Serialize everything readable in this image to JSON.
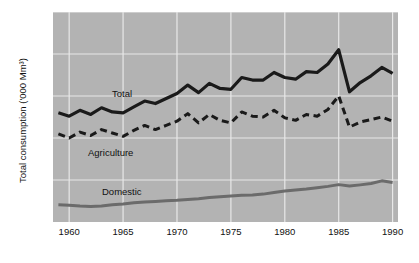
{
  "chart_data": {
    "type": "line",
    "title": "",
    "xlabel": "",
    "ylabel": "Total consumption ('000 Mm³)",
    "xlim": [
      1958.5,
      1990.5
    ],
    "ylim": [
      0,
      2.5
    ],
    "grid": true,
    "legend_position": "inline-annotations",
    "background_color": "#b3b3b3",
    "gridline_color": "#e8e8e8",
    "x_ticks": [
      1960,
      1965,
      1970,
      1975,
      1980,
      1985,
      1990
    ],
    "x_tick_labels": [
      "1960",
      "1965",
      "1970",
      "1975",
      "1980",
      "1985",
      "1990"
    ],
    "y_ticks": [
      0,
      0.5,
      1.0,
      1.5,
      2.0,
      2.5
    ],
    "y_tick_labels": [
      "0",
      ".5",
      "1.0",
      "1.5",
      "2.0",
      "2.5"
    ],
    "x": [
      1959,
      1960,
      1961,
      1962,
      1963,
      1964,
      1965,
      1966,
      1967,
      1968,
      1969,
      1970,
      1971,
      1972,
      1973,
      1974,
      1975,
      1976,
      1977,
      1978,
      1979,
      1980,
      1981,
      1982,
      1983,
      1984,
      1985,
      1986,
      1987,
      1988,
      1989,
      1990
    ],
    "series": [
      {
        "name": "Total",
        "label": "Total",
        "color": "#1a1a1a",
        "style": "solid",
        "width": 3.2,
        "values": [
          1.3,
          1.26,
          1.33,
          1.28,
          1.36,
          1.31,
          1.3,
          1.37,
          1.44,
          1.41,
          1.47,
          1.53,
          1.63,
          1.54,
          1.65,
          1.59,
          1.58,
          1.72,
          1.69,
          1.69,
          1.78,
          1.72,
          1.7,
          1.79,
          1.78,
          1.88,
          2.05,
          1.55,
          1.66,
          1.74,
          1.84,
          1.77
        ]
      },
      {
        "name": "Agriculture",
        "label": "Agriculture",
        "color": "#1a1a1a",
        "style": "dashed",
        "width": 3.0,
        "values": [
          1.05,
          1.0,
          1.07,
          1.03,
          1.1,
          1.06,
          1.02,
          1.09,
          1.15,
          1.1,
          1.15,
          1.2,
          1.29,
          1.18,
          1.28,
          1.21,
          1.18,
          1.31,
          1.26,
          1.25,
          1.33,
          1.24,
          1.21,
          1.28,
          1.26,
          1.34,
          1.5,
          1.13,
          1.19,
          1.22,
          1.25,
          1.2
        ]
      },
      {
        "name": "Domestic",
        "label": "Domestic",
        "color": "#6b6b6b",
        "style": "solid",
        "width": 3.0,
        "values": [
          0.205,
          0.2,
          0.19,
          0.186,
          0.19,
          0.205,
          0.215,
          0.228,
          0.238,
          0.245,
          0.252,
          0.258,
          0.268,
          0.278,
          0.292,
          0.302,
          0.31,
          0.318,
          0.322,
          0.332,
          0.352,
          0.37,
          0.382,
          0.392,
          0.408,
          0.424,
          0.445,
          0.428,
          0.442,
          0.458,
          0.49,
          0.47
        ]
      }
    ],
    "annotations": [
      {
        "text": "Total",
        "series": "Total"
      },
      {
        "text": "Agriculture",
        "series": "Agriculture"
      },
      {
        "text": "Domestic",
        "series": "Domestic"
      }
    ]
  }
}
